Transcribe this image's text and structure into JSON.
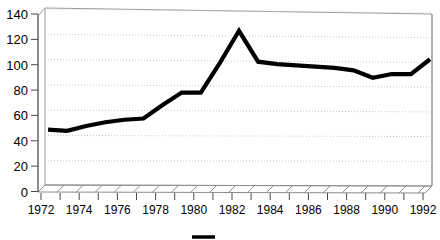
{
  "chart_data": {
    "type": "line",
    "title": "",
    "subtitle": "",
    "xlabel": "",
    "ylabel": "",
    "xlim": [
      1972,
      1992
    ],
    "ylim": [
      0,
      140
    ],
    "grid": true,
    "legend_position": "bottom",
    "style": "3d-perspective-line",
    "y_ticks": [
      0,
      20,
      40,
      60,
      80,
      100,
      120,
      140
    ],
    "y_tick_labels": [
      "0",
      "20",
      "40",
      "60",
      "80",
      "100",
      "120",
      "140"
    ],
    "x_ticks": [
      1972,
      1973,
      1974,
      1975,
      1976,
      1977,
      1978,
      1979,
      1980,
      1981,
      1982,
      1983,
      1984,
      1985,
      1986,
      1987,
      1988,
      1989,
      1990,
      1991,
      1992
    ],
    "x_tick_labels": [
      "1972",
      "1974",
      "1976",
      "1978",
      "1980",
      "1982",
      "1984",
      "1986",
      "1988",
      "1990",
      "1992"
    ],
    "x_labeled_years": [
      1972,
      1974,
      1976,
      1978,
      1980,
      1982,
      1984,
      1986,
      1988,
      1990,
      1992
    ],
    "categories": [
      1972,
      1973,
      1974,
      1975,
      1976,
      1977,
      1978,
      1979,
      1980,
      1981,
      1982,
      1983,
      1984,
      1985,
      1986,
      1987,
      1988,
      1989,
      1990,
      1991,
      1992
    ],
    "series": [
      {
        "name": "",
        "color": "#000000",
        "values": [
          46,
          45,
          49,
          52,
          54,
          55,
          66,
          76,
          76,
          100,
          126,
          101,
          99,
          98,
          97,
          96,
          94,
          88,
          91,
          91,
          103
        ]
      }
    ],
    "legend_entries": [
      {
        "label": "",
        "color": "#000000",
        "marker": "line"
      }
    ],
    "colors": {
      "series": "#000000",
      "grid": "#c8c8c8",
      "wall": "#9a9a9a",
      "floor": "#8d8d8d",
      "text": "#000000",
      "background": "#ffffff"
    }
  }
}
